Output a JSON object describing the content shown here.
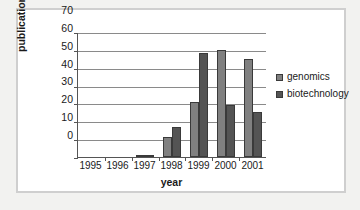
{
  "chart_data": {
    "type": "bar",
    "title": "",
    "xlabel": "year",
    "ylabel": "publications",
    "categories": [
      "1995",
      "1996",
      "1997",
      "1998",
      "1999",
      "2000",
      "2001"
    ],
    "series": [
      {
        "name": "genomics",
        "values": [
          0,
          0,
          1,
          11,
          31,
          60,
          55
        ]
      },
      {
        "name": "biotechnology",
        "values": [
          0,
          0,
          1,
          17,
          58,
          29,
          25
        ]
      }
    ],
    "ylim": [
      0,
      70
    ],
    "ytick_labels": [
      "70",
      "60",
      "50",
      "40",
      "30",
      "20",
      "10",
      "0"
    ],
    "ytick_values": [
      70,
      60,
      50,
      40,
      30,
      20,
      10,
      0
    ],
    "ytick_step": 10,
    "grid": "horizontal",
    "legend_position": "right",
    "colors": {
      "genomics": "#808080",
      "biotechnology": "#545454",
      "axis": "#555555",
      "gridline": "#8a8a8a",
      "bar_outline": "#3a3a3a",
      "card_border": "#cfcfcf",
      "page_background": "#f2f2f0",
      "plot_background": "#ffffff",
      "text": "#1a1a1a"
    }
  },
  "legend": {
    "items": [
      {
        "label": "genomics",
        "swatch": "legend-swatch-genomics"
      },
      {
        "label": "biotechnology",
        "swatch": "legend-swatch-biotechnology"
      }
    ]
  }
}
